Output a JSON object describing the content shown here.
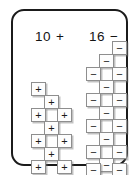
{
  "card": {
    "background_color": "#ffffff",
    "border_color": "#1b1b1b"
  },
  "columns": [
    {
      "id": "left",
      "count_label": "10",
      "operator_label": "+",
      "operator_name": "plus",
      "tile_glyph": "+",
      "tile_count": 10,
      "tiles": [
        {
          "label": "+",
          "x": 0,
          "y": 0
        },
        {
          "label": "+",
          "x": 13,
          "y": 13
        },
        {
          "label": "+",
          "x": 0,
          "y": 26
        },
        {
          "label": "+",
          "x": 26,
          "y": 26
        },
        {
          "label": "+",
          "x": 13,
          "y": 39
        },
        {
          "label": "+",
          "x": 0,
          "y": 52
        },
        {
          "label": "+",
          "x": 26,
          "y": 52
        },
        {
          "label": "+",
          "x": 13,
          "y": 65
        },
        {
          "label": "+",
          "x": 0,
          "y": 78
        },
        {
          "label": "+",
          "x": 26,
          "y": 78
        }
      ]
    },
    {
      "id": "right",
      "count_label": "16",
      "operator_label": "−",
      "operator_name": "minus",
      "tile_glyph": "−",
      "tile_count": 16,
      "tiles": [
        {
          "label": "−",
          "x": 26,
          "y": 0
        },
        {
          "label": "−",
          "x": 13,
          "y": 13
        },
        {
          "label": "−",
          "x": 0,
          "y": 26
        },
        {
          "label": "−",
          "x": 26,
          "y": 26
        },
        {
          "label": "−",
          "x": 13,
          "y": 39
        },
        {
          "label": "−",
          "x": 0,
          "y": 52
        },
        {
          "label": "−",
          "x": 26,
          "y": 52
        },
        {
          "label": "−",
          "x": 13,
          "y": 65
        },
        {
          "label": "−",
          "x": 0,
          "y": 78
        },
        {
          "label": "−",
          "x": 26,
          "y": 78
        },
        {
          "label": "−",
          "x": 13,
          "y": 91
        },
        {
          "label": "−",
          "x": 0,
          "y": 104
        },
        {
          "label": "−",
          "x": 26,
          "y": 104
        },
        {
          "label": "−",
          "x": 13,
          "y": 117
        },
        {
          "label": "−",
          "x": 0,
          "y": 122
        },
        {
          "label": "−",
          "x": 26,
          "y": 122
        }
      ]
    }
  ]
}
